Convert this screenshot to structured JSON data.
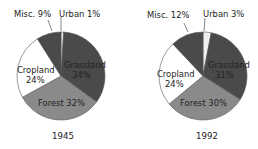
{
  "chart_data": [
    {
      "type": "pie",
      "title": "1945",
      "slices": [
        {
          "label": "Urban",
          "value": 1,
          "color": "#f0f0f0"
        },
        {
          "label": "Grassland",
          "value": 34,
          "color": "#4a4a4a"
        },
        {
          "label": "Forest",
          "value": 32,
          "color": "#8a8a8a"
        },
        {
          "label": "Cropland",
          "value": 24,
          "color": "#ffffff"
        },
        {
          "label": "Misc.",
          "value": 9,
          "color": "#4a4a4a"
        }
      ],
      "labels": {
        "urban": "Urban 1%",
        "misc": "Misc. 9%",
        "cropland_name": "Cropland",
        "cropland_pct": "24%",
        "grassland_name": "Grassland",
        "grassland_pct": "34%",
        "forest": "Forest 32%"
      }
    },
    {
      "type": "pie",
      "title": "1992",
      "slices": [
        {
          "label": "Urban",
          "value": 3,
          "color": "#f0f0f0"
        },
        {
          "label": "Grassland",
          "value": 31,
          "color": "#4a4a4a"
        },
        {
          "label": "Forest",
          "value": 30,
          "color": "#8a8a8a"
        },
        {
          "label": "Cropland",
          "value": 24,
          "color": "#ffffff"
        },
        {
          "label": "Misc.",
          "value": 12,
          "color": "#4a4a4a"
        }
      ],
      "labels": {
        "urban": "Urban 3%",
        "misc": "Misc. 12%",
        "cropland_name": "Cropland",
        "cropland_pct": "24%",
        "grassland_name": "Grassland",
        "grassland_pct": "31%",
        "forest": "Forest 30%"
      }
    }
  ]
}
